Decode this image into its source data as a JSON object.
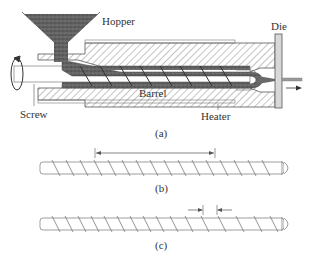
{
  "figure": {
    "panel_a": {
      "caption": "(a)",
      "labels": {
        "hopper": "Hopper",
        "die": "Die",
        "barrel": "Barrel",
        "heater": "Heater",
        "screw": "Screw"
      }
    },
    "panel_b": {
      "caption": "(b)"
    },
    "panel_c": {
      "caption": "(c)"
    }
  },
  "colors": {
    "line": "#555555",
    "hatch": "#8a8a8a",
    "material": "#5a5a5a",
    "die_fill": "#d8d8d8"
  }
}
